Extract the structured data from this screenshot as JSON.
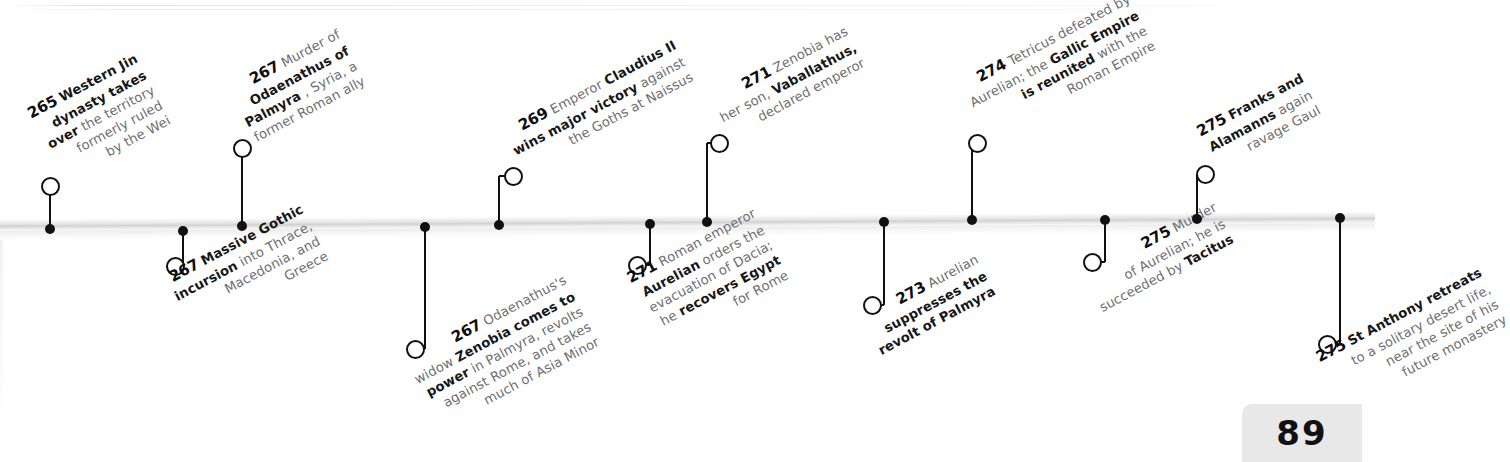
{
  "page": {
    "number": "89",
    "era_label": "Roman timeline 265–275 AD"
  },
  "colors": {
    "ink": "#111114",
    "muted_text": "#6e6e72",
    "axis": "#d2d2d2",
    "page_plate": "#e8e8e8"
  },
  "chart_data": {
    "type": "timeline",
    "xlabel": "",
    "ylabel": "",
    "axis": {
      "orientation": "horizontal",
      "grid": false,
      "tick_labels": []
    },
    "legend": {
      "position": "none",
      "entries": []
    },
    "events": [
      {
        "year": "265",
        "side": "above",
        "text": "265 Western Jin dynasty takes over the territory formerly ruled by the Wei"
      },
      {
        "year": "267",
        "side": "below",
        "text": "267 Massive Gothic incursion into Thrace, Macedonia, and Greece"
      },
      {
        "year": "267",
        "side": "above",
        "text": "267 Murder of Odaenathus of Palmyra, Syria, a former Roman ally"
      },
      {
        "year": "267",
        "side": "below",
        "text": "267 Odaenathus's widow Zenobia comes to power in Palmyra, revolts against Rome, and takes much of Asia Minor"
      },
      {
        "year": "269",
        "side": "above",
        "text": "269 Emperor Claudius II wins major victory against the Goths at Naissus"
      },
      {
        "year": "271",
        "side": "below",
        "text": "271 Roman emperor Aurelian orders the evacuation of Dacia; he recovers Egypt for Rome"
      },
      {
        "year": "271",
        "side": "above",
        "text": "271 Zenobia has her son, Vaballathus, declared emperor"
      },
      {
        "year": "273",
        "side": "below",
        "text": "273 Aurelian suppresses the revolt of Palmyra"
      },
      {
        "year": "274",
        "side": "above",
        "text": "274 Tetricus defeated by Aurelian; the Gallic Empire is reunited with the Roman Empire"
      },
      {
        "year": "275",
        "side": "below",
        "text": "275 Murder of Aurelian; he is succeeded by Tacitus"
      },
      {
        "year": "275",
        "side": "above",
        "text": "275 Franks and Alamanns again ravage Gaul"
      },
      {
        "year": "275",
        "side": "below",
        "text": "275 St Anthony retreats to a solitary desert life, near the site of his future monastery"
      }
    ]
  },
  "events": [
    {
      "id": "e265-jin",
      "year": "265",
      "side": "above",
      "lines": [
        [
          {
            "t": "265",
            "s": "year"
          },
          {
            "t": "Western Jin",
            "s": "b"
          }
        ],
        [
          {
            "t": "dynasty takes",
            "s": "b"
          }
        ],
        [
          {
            "t": "over",
            "s": "b"
          },
          {
            "t": "the territory",
            "s": "n"
          }
        ],
        [
          {
            "t": "formerly ruled",
            "s": "n"
          }
        ],
        [
          {
            "t": "by the Wei",
            "s": "n"
          }
        ]
      ]
    },
    {
      "id": "e267-goth",
      "year": "267",
      "side": "below",
      "lines": [
        [
          {
            "t": "267",
            "s": "year"
          },
          {
            "t": "Massive Gothic",
            "s": "b"
          }
        ],
        [
          {
            "t": "incursion",
            "s": "b"
          },
          {
            "t": "into Thrace,",
            "s": "n"
          }
        ],
        [
          {
            "t": "Macedonia, and",
            "s": "n"
          }
        ],
        [
          {
            "t": "Greece",
            "s": "n"
          }
        ]
      ]
    },
    {
      "id": "e267-odaenathus",
      "year": "267",
      "side": "above",
      "lines": [
        [
          {
            "t": "267",
            "s": "year"
          },
          {
            "t": "Murder of",
            "s": "n"
          }
        ],
        [
          {
            "t": "Odaenathus of",
            "s": "b"
          }
        ],
        [
          {
            "t": "Palmyra",
            "s": "b"
          },
          {
            "t": ", Syria, a",
            "s": "n"
          }
        ],
        [
          {
            "t": "former Roman ally",
            "s": "n"
          }
        ]
      ]
    },
    {
      "id": "e267-zenobia",
      "year": "267",
      "side": "below",
      "lines": [
        [
          {
            "t": "267",
            "s": "year"
          },
          {
            "t": "Odaenathus's",
            "s": "n"
          }
        ],
        [
          {
            "t": "widow",
            "s": "n"
          },
          {
            "t": "Zenobia comes to",
            "s": "b"
          }
        ],
        [
          {
            "t": "power",
            "s": "b"
          },
          {
            "t": "in Palmyra, revolts",
            "s": "n"
          }
        ],
        [
          {
            "t": "against Rome, and takes",
            "s": "n"
          }
        ],
        [
          {
            "t": "much of Asia Minor",
            "s": "n"
          }
        ]
      ]
    },
    {
      "id": "e269-claudius",
      "year": "269",
      "side": "above",
      "lines": [
        [
          {
            "t": "269",
            "s": "year"
          },
          {
            "t": "Emperor",
            "s": "n"
          },
          {
            "t": "Claudius II",
            "s": "b"
          }
        ],
        [
          {
            "t": "wins major victory",
            "s": "b"
          },
          {
            "t": "against",
            "s": "n"
          }
        ],
        [
          {
            "t": "the Goths at Naissus",
            "s": "n"
          }
        ]
      ]
    },
    {
      "id": "e271-dacia",
      "year": "271",
      "side": "below",
      "lines": [
        [
          {
            "t": "271",
            "s": "year"
          },
          {
            "t": "Roman emperor",
            "s": "n"
          }
        ],
        [
          {
            "t": "Aurelian",
            "s": "b"
          },
          {
            "t": "orders the",
            "s": "n"
          }
        ],
        [
          {
            "t": "evacuation of Dacia;",
            "s": "n"
          }
        ],
        [
          {
            "t": "he",
            "s": "n"
          },
          {
            "t": "recovers Egypt",
            "s": "b"
          }
        ],
        [
          {
            "t": "for Rome",
            "s": "n"
          }
        ]
      ]
    },
    {
      "id": "e271-vaballathus",
      "year": "271",
      "side": "above",
      "lines": [
        [
          {
            "t": "271",
            "s": "year"
          },
          {
            "t": "Zenobia has",
            "s": "n"
          }
        ],
        [
          {
            "t": "her son,",
            "s": "n"
          },
          {
            "t": "Vaballathus,",
            "s": "b"
          }
        ],
        [
          {
            "t": "declared emperor",
            "s": "n"
          }
        ]
      ]
    },
    {
      "id": "e273-palmyra",
      "year": "273",
      "side": "below",
      "lines": [
        [
          {
            "t": "273",
            "s": "year"
          },
          {
            "t": "Aurelian",
            "s": "n"
          }
        ],
        [
          {
            "t": "suppresses the",
            "s": "b"
          }
        ],
        [
          {
            "t": "revolt of Palmyra",
            "s": "b"
          }
        ]
      ]
    },
    {
      "id": "e274-tetricus",
      "year": "274",
      "side": "above",
      "lines": [
        [
          {
            "t": "274",
            "s": "year"
          },
          {
            "t": "Tetricus defeated by",
            "s": "n"
          }
        ],
        [
          {
            "t": "Aurelian; the",
            "s": "n"
          },
          {
            "t": "Gallic Empire",
            "s": "b"
          }
        ],
        [
          {
            "t": "is reunited",
            "s": "b"
          },
          {
            "t": "with the",
            "s": "n"
          }
        ],
        [
          {
            "t": "Roman Empire",
            "s": "n"
          }
        ]
      ]
    },
    {
      "id": "e275-aurelian-murder",
      "year": "275",
      "side": "below",
      "lines": [
        [
          {
            "t": "275",
            "s": "year"
          },
          {
            "t": "Murder",
            "s": "n"
          }
        ],
        [
          {
            "t": "of Aurelian; he is",
            "s": "n"
          }
        ],
        [
          {
            "t": "succeeded by",
            "s": "n"
          },
          {
            "t": "Tacitus",
            "s": "b"
          }
        ]
      ]
    },
    {
      "id": "e275-franks",
      "year": "275",
      "side": "above",
      "lines": [
        [
          {
            "t": "275",
            "s": "year"
          },
          {
            "t": "Franks and",
            "s": "b"
          }
        ],
        [
          {
            "t": "Alamanns",
            "s": "b"
          },
          {
            "t": "again",
            "s": "n"
          }
        ],
        [
          {
            "t": "ravage Gaul",
            "s": "n"
          }
        ]
      ]
    },
    {
      "id": "e275-anthony",
      "year": "275",
      "side": "below",
      "lines": [
        [
          {
            "t": "275",
            "s": "year"
          },
          {
            "t": "St Anthony retreats",
            "s": "b"
          }
        ],
        [
          {
            "t": "to a solitary desert life,",
            "s": "n"
          }
        ],
        [
          {
            "t": "near the site of his",
            "s": "n"
          }
        ],
        [
          {
            "t": "future monastery",
            "s": "n"
          }
        ]
      ]
    }
  ]
}
